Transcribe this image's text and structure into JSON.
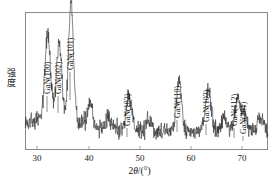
{
  "figure": {
    "background_color": "#ffffff",
    "frame_color": "#8a8a8a",
    "trace_color": "#333333"
  },
  "axes": {
    "x_title_prefix": "2",
    "x_title_theta": "θ",
    "x_title_suffix": "/(°)",
    "x_title_full": "2θ/(°)",
    "y_title_char1": "强",
    "y_title_char2": "度",
    "y_title_full": "强度",
    "x_ticks": [
      "30",
      "40",
      "50",
      "60",
      "70"
    ]
  },
  "peaks": [
    {
      "label": "GaN(100)"
    },
    {
      "label": "GaN(002)"
    },
    {
      "label": "GaN(101)"
    },
    {
      "label": "GaN(102)"
    },
    {
      "label": "GaN(110)"
    },
    {
      "label": "GaN(103)"
    },
    {
      "label": "GaN(112)"
    },
    {
      "label": "GaN(201)"
    }
  ],
  "chart_data": {
    "type": "line",
    "title": "",
    "subtitle": "",
    "xlabel": "2θ/(°)",
    "ylabel": "强度",
    "xlim": [
      28.0,
      75.0
    ],
    "ylim": [
      0,
      100
    ],
    "grid": false,
    "legend": null,
    "x_tick_values": [
      30,
      40,
      50,
      60,
      70
    ],
    "x_tick_labels": [
      "30",
      "40",
      "50",
      "60",
      "70"
    ],
    "y_tick_values": [],
    "y_tick_labels": [],
    "series": [
      {
        "name": "GaN XRD pattern",
        "color": "#333333",
        "baseline": 14,
        "noise_amplitude": 7,
        "peaks": [
          {
            "label": "GaN(100)",
            "two_theta": 32.4,
            "height": 62,
            "width": 0.55
          },
          {
            "label": "GaN(002)",
            "two_theta": 34.6,
            "height": 58,
            "width": 0.5
          },
          {
            "label": "GaN(101)",
            "two_theta": 36.9,
            "height": 92,
            "width": 0.48
          },
          {
            "label": "GaN(102)",
            "two_theta": 48.1,
            "height": 26,
            "width": 0.55
          },
          {
            "label": "GaN(110)",
            "two_theta": 57.8,
            "height": 38,
            "width": 0.5
          },
          {
            "label": "GaN(103)",
            "two_theta": 63.5,
            "height": 30,
            "width": 0.55
          },
          {
            "label": "GaN(112)",
            "two_theta": 69.1,
            "height": 24,
            "width": 0.55
          },
          {
            "label": "GaN(201)",
            "two_theta": 70.5,
            "height": 14,
            "width": 0.5
          }
        ],
        "minor_bumps": [
          {
            "two_theta": 40.5,
            "height": 18,
            "width": 0.5
          },
          {
            "two_theta": 44.2,
            "height": 10,
            "width": 0.55
          },
          {
            "two_theta": 52.0,
            "height": 8,
            "width": 0.6
          },
          {
            "two_theta": 66.5,
            "height": 7,
            "width": 0.6
          },
          {
            "two_theta": 73.5,
            "height": 9,
            "width": 0.6
          }
        ]
      }
    ]
  },
  "peak_label_layout": [
    {
      "label": "GaN(100)",
      "x": 44,
      "y": 94,
      "leader_x": 47,
      "leader_top": 96,
      "leader_bottom": 112
    },
    {
      "label": "GaN(002)",
      "x": 55,
      "y": 94,
      "leader_x": 58,
      "leader_top": 96,
      "leader_bottom": 113
    },
    {
      "label": "GaN(101)",
      "x": 67,
      "y": 70,
      "leader_x": 70,
      "leader_top": 72,
      "leader_bottom": 100
    },
    {
      "label": "GaN(102)",
      "x": 124,
      "y": 126,
      "leader_x": 127,
      "leader_top": 128,
      "leader_bottom": 137
    },
    {
      "label": "GaN(110)",
      "x": 174,
      "y": 118,
      "leader_x": 177,
      "leader_top": 120,
      "leader_bottom": 132
    },
    {
      "label": "GaN(103)",
      "x": 203,
      "y": 122,
      "leader_x": 206,
      "leader_top": 124,
      "leader_bottom": 135
    },
    {
      "label": "GaN(112)",
      "x": 231,
      "y": 126,
      "leader_x": 234,
      "leader_top": 128,
      "leader_bottom": 138
    },
    {
      "label": "GaN(201)",
      "x": 240,
      "y": 134,
      "leader_x": 243,
      "leader_top": 136,
      "leader_bottom": 141
    }
  ],
  "x_tick_layout": [
    {
      "label": "30",
      "px": 37
    },
    {
      "label": "40",
      "px": 89
    },
    {
      "label": "50",
      "px": 140
    },
    {
      "label": "60",
      "px": 191
    },
    {
      "label": "70",
      "px": 242
    }
  ]
}
